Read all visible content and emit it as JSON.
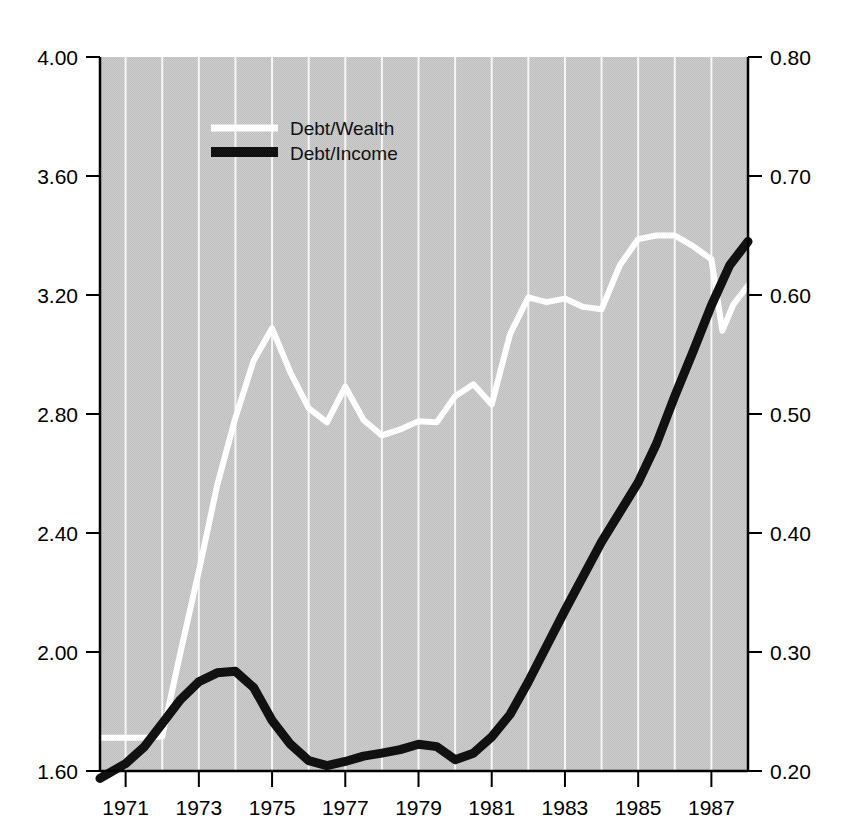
{
  "chart_data": {
    "type": "line",
    "title": "",
    "xlabel": "",
    "ylabel_left": "",
    "ylabel_right": "",
    "grid": true,
    "legend_position": "top-left-inside",
    "xlim": [
      1970.3,
      1988.0
    ],
    "xticks": [
      1971,
      1973,
      1975,
      1977,
      1979,
      1981,
      1983,
      1985,
      1987
    ],
    "xtick_labels": [
      "1971",
      "1973",
      "1975",
      "1977",
      "1979",
      "1981",
      "1983",
      "1985",
      "1987"
    ],
    "gridline_years": [
      1971,
      1972,
      1973,
      1974,
      1975,
      1976,
      1977,
      1978,
      1979,
      1980,
      1981,
      1982,
      1983,
      1984,
      1985,
      1986,
      1987
    ],
    "ylim_left": [
      1.6,
      4.0
    ],
    "yticks_left": [
      1.6,
      2.0,
      2.4,
      2.8,
      3.2,
      3.6,
      4.0
    ],
    "ytick_labels_left": [
      "1.60",
      "2.00",
      "2.40",
      "2.80",
      "3.20",
      "3.60",
      "4.00"
    ],
    "ylim_right": [
      0.2,
      0.8
    ],
    "yticks_right": [
      0.2,
      0.3,
      0.4,
      0.5,
      0.6,
      0.7,
      0.8
    ],
    "ytick_labels_right": [
      "0.20",
      "0.30",
      "0.40",
      "0.50",
      "0.60",
      "0.70",
      "0.80"
    ],
    "series": [
      {
        "name": "Debt/Wealth",
        "axis": "right",
        "color": "#ffffff",
        "x": [
          1970.3,
          1971.0,
          1971.5,
          1972.0,
          1972.5,
          1973.0,
          1973.5,
          1974.0,
          1974.5,
          1975.0,
          1975.5,
          1976.0,
          1976.5,
          1977.0,
          1977.5,
          1978.0,
          1978.5,
          1979.0,
          1979.5,
          1980.0,
          1980.5,
          1981.0,
          1981.5,
          1982.0,
          1982.5,
          1983.0,
          1983.5,
          1984.0,
          1984.5,
          1985.0,
          1985.5,
          1986.0,
          1986.5,
          1987.0,
          1987.3,
          1987.6,
          1988.0
        ],
        "values": [
          0.228,
          0.228,
          0.228,
          0.229,
          0.3,
          0.368,
          0.44,
          0.497,
          0.545,
          0.572,
          0.535,
          0.505,
          0.493,
          0.523,
          0.495,
          0.482,
          0.487,
          0.494,
          0.493,
          0.515,
          0.525,
          0.508,
          0.567,
          0.598,
          0.594,
          0.597,
          0.59,
          0.588,
          0.625,
          0.647,
          0.65,
          0.65,
          0.641,
          0.63,
          0.57,
          0.592,
          0.608
        ]
      },
      {
        "name": "Debt/Income",
        "axis": "left",
        "color": "#111111",
        "x": [
          1970.3,
          1971.0,
          1971.5,
          1972.0,
          1972.5,
          1973.0,
          1973.5,
          1974.0,
          1974.5,
          1975.0,
          1975.5,
          1976.0,
          1976.5,
          1977.0,
          1977.5,
          1978.0,
          1978.5,
          1979.0,
          1979.5,
          1980.0,
          1980.5,
          1981.0,
          1981.5,
          1982.0,
          1982.5,
          1983.0,
          1983.5,
          1984.0,
          1984.5,
          1985.0,
          1985.5,
          1986.0,
          1986.5,
          1987.0,
          1987.5,
          1988.0
        ],
        "values": [
          1.575,
          1.625,
          1.68,
          1.76,
          1.84,
          1.9,
          1.93,
          1.935,
          1.88,
          1.77,
          1.69,
          1.635,
          1.618,
          1.632,
          1.65,
          1.66,
          1.672,
          1.69,
          1.682,
          1.638,
          1.66,
          1.715,
          1.79,
          1.9,
          2.02,
          2.14,
          2.255,
          2.37,
          2.47,
          2.57,
          2.7,
          2.86,
          3.01,
          3.165,
          3.3,
          3.38
        ]
      }
    ]
  },
  "legend": {
    "entries": [
      {
        "label": "Debt/Wealth",
        "color": "#ffffff"
      },
      {
        "label": "Debt/Income",
        "color": "#111111"
      }
    ]
  },
  "plot_style": {
    "background": "#c9c9c9",
    "gridline_color": "#ffffff",
    "axis_color": "#000000",
    "page_background": "#ffffff"
  }
}
